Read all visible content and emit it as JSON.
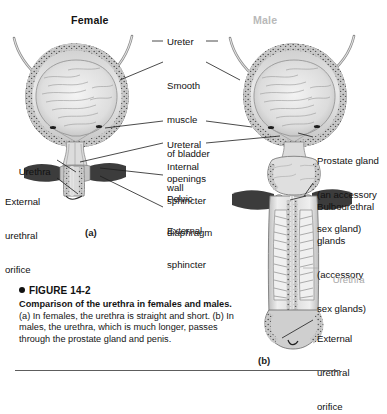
{
  "figure": {
    "panel_titles": {
      "female": "Female",
      "male": "Male"
    },
    "panel_marks": {
      "a": "(a)",
      "b": "(b)"
    },
    "colors": {
      "female_title": "#141414",
      "male_title": "#b9b9b9",
      "label_text": "#111111",
      "gray_label": "#a9a9a9",
      "leader_line": "#1d1d1d",
      "rule": "#5d5d5d",
      "muscle_dark": "#3b3b3b",
      "tissue_mid": "#9a9a9a",
      "tissue_light": "#d8d8d8"
    }
  },
  "center_labels": [
    {
      "name": "ureter",
      "lines": [
        "Ureter"
      ]
    },
    {
      "name": "smooth-muscle",
      "lines": [
        "Smooth",
        "muscle",
        "of bladder",
        "wall"
      ]
    },
    {
      "name": "ureteral-openings",
      "lines": [
        "Ureteral",
        "openings"
      ]
    },
    {
      "name": "internal-sphincter",
      "lines": [
        "Internal",
        "sphincter"
      ]
    },
    {
      "name": "pelvic-diaphragm",
      "lines": [
        "Pelvic",
        "diaphragm"
      ]
    },
    {
      "name": "external-sphincter",
      "lines": [
        "External",
        "sphincter"
      ]
    }
  ],
  "left_labels": [
    {
      "name": "urethra",
      "lines": [
        "Urethra"
      ]
    },
    {
      "name": "external-urethral-orifice",
      "lines": [
        "External",
        "urethral",
        "orifice"
      ]
    }
  ],
  "right_labels": [
    {
      "name": "prostate-gland",
      "lines": [
        "Prostate gland",
        "(an accessory",
        "sex gland)"
      ]
    },
    {
      "name": "bulbourethral-glands",
      "lines": [
        "Bulbourethral",
        "glands",
        "(accessory",
        "sex glands)"
      ]
    },
    {
      "name": "urethra-male",
      "lines": [
        "Urethra"
      ],
      "gray": true
    },
    {
      "name": "external-urethral-orifice-male",
      "lines": [
        "External",
        "urethral",
        "orifice"
      ]
    }
  ],
  "caption": {
    "bullet": "●",
    "number": "FIGURE 14-2",
    "title": "Comparison of the urethra in females and males.",
    "body": " (a) In females, the urethra is straight and short. (b) In males, the urethra, which is much longer, passes through the prostate gland and penis."
  }
}
